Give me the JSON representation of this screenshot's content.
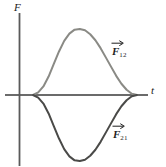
{
  "figure": {
    "kind": "physics-force-vs-time-plot",
    "background_color": "#ffffff",
    "axis_color": "#3a3a3a",
    "curve_upper_color": "#8a8a85",
    "curve_lower_color": "#4a4a48",
    "axes": {
      "y_label": "F",
      "x_label": "t"
    },
    "annotations": {
      "upper_curve_label": "F",
      "upper_curve_subscript": "12",
      "lower_curve_label": "F",
      "lower_curve_subscript": "21"
    }
  },
  "chart_data": {
    "type": "line",
    "title": "",
    "xlabel": "t",
    "ylabel": "F",
    "grid": false,
    "legend": "inline-annotations",
    "xlim": [
      0,
      1
    ],
    "ylim": [
      -1,
      1
    ],
    "x": [
      0.0,
      0.05,
      0.1,
      0.15,
      0.2,
      0.25,
      0.3,
      0.35,
      0.4,
      0.45,
      0.5,
      0.55,
      0.6,
      0.65,
      0.7,
      0.75,
      0.8,
      0.85,
      0.9,
      0.95,
      1.0
    ],
    "series": [
      {
        "name": "F12",
        "label": "F₁₂",
        "color": "#8a8a85",
        "values": [
          0.0,
          0.04,
          0.13,
          0.28,
          0.47,
          0.66,
          0.82,
          0.93,
          0.99,
          1.0,
          0.98,
          0.92,
          0.83,
          0.71,
          0.57,
          0.43,
          0.29,
          0.17,
          0.08,
          0.02,
          0.0
        ]
      },
      {
        "name": "F21",
        "label": "F₂₁",
        "color": "#4a4a48",
        "values": [
          0.0,
          -0.04,
          -0.13,
          -0.28,
          -0.47,
          -0.66,
          -0.82,
          -0.93,
          -0.99,
          -1.0,
          -0.98,
          -0.92,
          -0.83,
          -0.71,
          -0.57,
          -0.43,
          -0.29,
          -0.17,
          -0.08,
          -0.02,
          0.0
        ]
      }
    ],
    "annotations": [
      {
        "text": "F12",
        "series": "F12",
        "position": "upper-right"
      },
      {
        "text": "F21",
        "series": "F21",
        "position": "lower-right"
      }
    ]
  }
}
